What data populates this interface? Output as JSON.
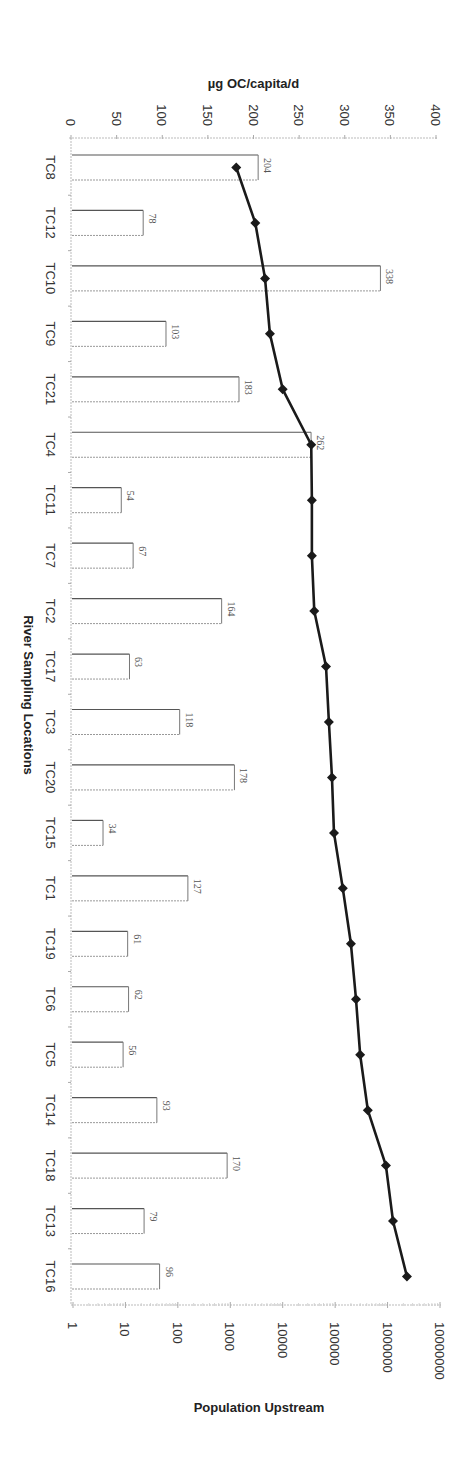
{
  "chart_data": {
    "type": "bar+line",
    "orientation": "rotated-90-clockwise",
    "categories": [
      "TC8",
      "TC12",
      "TC10",
      "TC9",
      "TC21",
      "TC4",
      "TC11",
      "TC7",
      "TC2",
      "TC17",
      "TC3",
      "TC20",
      "TC15",
      "TC1",
      "TC19",
      "TC6",
      "TC5",
      "TC14",
      "TC18",
      "TC13",
      "TC16"
    ],
    "series": [
      {
        "name": "µg OC/capita/d",
        "type": "bar",
        "axis": "primary",
        "values": [
          204,
          78,
          338,
          103,
          183,
          262,
          54,
          67,
          164,
          63,
          118,
          178,
          34,
          127,
          61,
          62,
          56,
          93,
          170,
          79,
          96
        ]
      },
      {
        "name": "Population Upstream",
        "type": "line",
        "axis": "secondary-log",
        "marker": "diamond",
        "values": [
          1300,
          3000,
          4600,
          5700,
          10000,
          35000,
          36000,
          36000,
          40000,
          67000,
          76000,
          87000,
          95000,
          140000,
          200000,
          250000,
          300000,
          420000,
          930000,
          1270000,
          2340000
        ]
      }
    ],
    "title": "",
    "xlabel": "River Sampling Locations",
    "ylabel": "µg OC/capita/d",
    "y2label": "Population Upstream",
    "ylim": [
      0,
      400
    ],
    "yticks": [
      "0",
      "50",
      "100",
      "150",
      "200",
      "250",
      "300",
      "350",
      "400"
    ],
    "y2lim": [
      1,
      10000000
    ],
    "y2scale": "log",
    "y2ticks": [
      "1",
      "10",
      "100",
      "1000",
      "10000",
      "100000",
      "1000000",
      "10000000"
    ],
    "grid": false,
    "legend": null
  },
  "colors": {
    "bar_stroke": "#555555",
    "line": "#1a1a1a",
    "marker": "#1a1a1a",
    "axis": "#bbbbbb",
    "text": "#333333"
  }
}
